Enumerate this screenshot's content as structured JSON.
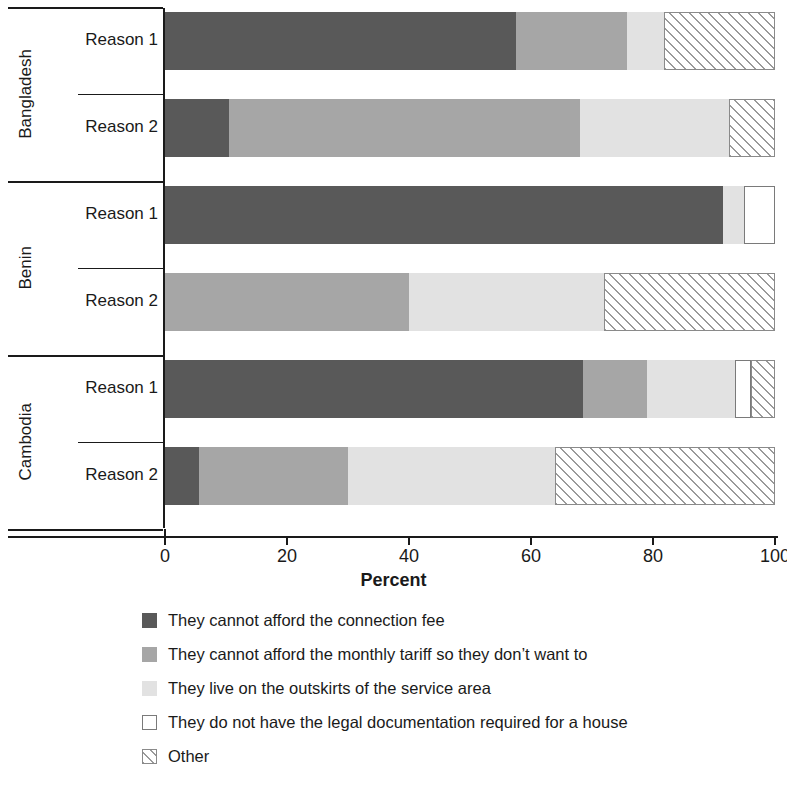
{
  "chart_data": {
    "type": "bar",
    "subtype": "horizontal stacked bar",
    "title": "",
    "xlabel": "Percent",
    "ylabel": "",
    "xlim": [
      0,
      100
    ],
    "xticks": [
      0,
      20,
      40,
      60,
      80,
      100
    ],
    "grid": false,
    "legend_position": "bottom",
    "stacked": true,
    "units": "percent",
    "groups": [
      "Bangladesh",
      "Benin",
      "Cambodia"
    ],
    "bars_per_group": [
      "Reason 1",
      "Reason 2"
    ],
    "series": [
      {
        "name": "They cannot afford the connection fee",
        "color": "#595959",
        "pattern": "solid",
        "values": [
          57.5,
          10.5,
          91.5,
          0,
          68.5,
          5.5
        ]
      },
      {
        "name": "They cannot afford the monthly tariff so they don’t want to",
        "color": "#a6a6a6",
        "pattern": "solid",
        "values": [
          18.3,
          57.5,
          0,
          40.0,
          10.5,
          24.5
        ]
      },
      {
        "name": "They live on the outskirts of the service area",
        "color": "#e2e2e2",
        "pattern": "solid",
        "values": [
          6.0,
          24.5,
          3.5,
          32.0,
          14.5,
          34.0
        ]
      },
      {
        "name": "They do not have the legal documentation required for a house",
        "color": "#ffffff",
        "pattern": "outline",
        "values": [
          0,
          0,
          5.0,
          0,
          2.5,
          0
        ]
      },
      {
        "name": "Other",
        "color": "#ffffff",
        "pattern": "diagonal-hatch",
        "values": [
          18.2,
          7.5,
          0,
          28.0,
          4.0,
          36.0
        ]
      }
    ],
    "bars": [
      {
        "group": "Bangladesh",
        "reason": "Reason 1",
        "segments": [
          57.5,
          18.3,
          6.0,
          0,
          18.2
        ]
      },
      {
        "group": "Bangladesh",
        "reason": "Reason 2",
        "segments": [
          10.5,
          57.5,
          24.5,
          0,
          7.5
        ]
      },
      {
        "group": "Benin",
        "reason": "Reason 1",
        "segments": [
          91.5,
          0,
          3.5,
          5.0,
          0
        ]
      },
      {
        "group": "Benin",
        "reason": "Reason 2",
        "segments": [
          0,
          40.0,
          32.0,
          0,
          28.0
        ]
      },
      {
        "group": "Cambodia",
        "reason": "Reason 1",
        "segments": [
          68.5,
          10.5,
          14.5,
          2.5,
          4.0
        ]
      },
      {
        "group": "Cambodia",
        "reason": "Reason 2",
        "segments": [
          5.5,
          24.5,
          34.0,
          0,
          36.0
        ]
      }
    ]
  },
  "axis": {
    "title": "Percent",
    "ticks": [
      {
        "value": 0,
        "label": "0"
      },
      {
        "value": 20,
        "label": "20"
      },
      {
        "value": 40,
        "label": "40"
      },
      {
        "value": 60,
        "label": "60"
      },
      {
        "value": 80,
        "label": "80"
      },
      {
        "value": 100,
        "label": "100"
      }
    ]
  },
  "groups": [
    {
      "country": "Bangladesh",
      "rows": [
        {
          "label": "Reason 1"
        },
        {
          "label": "Reason 2"
        }
      ]
    },
    {
      "country": "Benin",
      "rows": [
        {
          "label": "Reason 1"
        },
        {
          "label": "Reason 2"
        }
      ]
    },
    {
      "country": "Cambodia",
      "rows": [
        {
          "label": "Reason 1"
        },
        {
          "label": "Reason 2"
        }
      ]
    }
  ],
  "legend": {
    "items": [
      {
        "swatch": "solid-dark-gray-swatch",
        "label": "They cannot afford the connection fee"
      },
      {
        "swatch": "solid-medium-gray-swatch",
        "label": "They cannot afford the monthly tariff so they don’t want to"
      },
      {
        "swatch": "solid-light-gray-swatch",
        "label": "They live on the outskirts of the service area"
      },
      {
        "swatch": "outlined-white-swatch",
        "label": "They do not have the legal documentation required for a house"
      },
      {
        "swatch": "diagonal-hatch-swatch",
        "label": "Other"
      }
    ]
  },
  "colors": {
    "dark_gray": "#595959",
    "medium_gray": "#a6a6a6",
    "light_gray": "#e2e2e2",
    "white": "#ffffff",
    "hatch_line": "#9a9a9a",
    "axis": "#1a1a1a"
  }
}
